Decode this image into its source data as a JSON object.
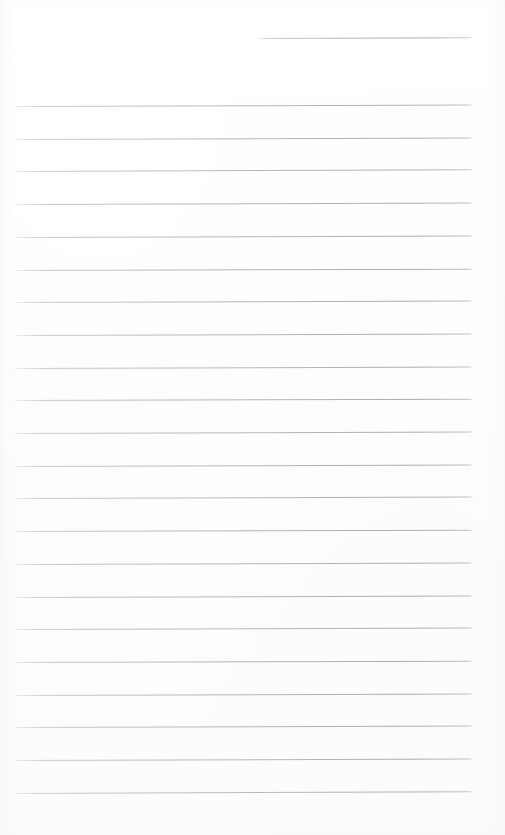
{
  "document": {
    "kind": "scanned-page",
    "subject": "blank ruled notepad page",
    "text_content": "",
    "handwriting_present": false,
    "printed_text_present": false,
    "page_width": 505,
    "page_height": 835
  },
  "colors": {
    "paper": "#fdfdfd",
    "page_border": "#ffffff",
    "rule_line": "#acacb4",
    "rule_line_faded": "#c6c6cb"
  },
  "ruling": {
    "style": "horizontal lined",
    "total_rules": 23,
    "body_rule_count": 22,
    "short_rule_count": 1,
    "line_spacing_px": 32.7,
    "line_thickness_px": 1,
    "body_left_x": 15,
    "body_right_x": 473,
    "first_body_rule_y": 106,
    "last_body_rule_y": 793,
    "scan_skew_deg": -0.18
  },
  "short_rule": {
    "label": "top-right short rule",
    "x": 258,
    "y": 38,
    "width": 214,
    "skew_deg": -0.22
  },
  "body_rules": [
    {
      "index": 1,
      "y": 106.0,
      "x": 15,
      "width": 458,
      "skew_deg": -0.2,
      "opacity": 0.92
    },
    {
      "index": 2,
      "y": 138.7,
      "x": 15,
      "width": 458,
      "skew_deg": -0.19,
      "opacity": 0.95
    },
    {
      "index": 3,
      "y": 171.4,
      "x": 15,
      "width": 458,
      "skew_deg": -0.21,
      "opacity": 0.93
    },
    {
      "index": 4,
      "y": 204.1,
      "x": 15,
      "width": 458,
      "skew_deg": -0.18,
      "opacity": 0.96
    },
    {
      "index": 5,
      "y": 236.8,
      "x": 15,
      "width": 458,
      "skew_deg": -0.2,
      "opacity": 0.94
    },
    {
      "index": 6,
      "y": 269.5,
      "x": 15,
      "width": 458,
      "skew_deg": -0.17,
      "opacity": 0.97
    },
    {
      "index": 7,
      "y": 302.2,
      "x": 15,
      "width": 458,
      "skew_deg": -0.19,
      "opacity": 0.95
    },
    {
      "index": 8,
      "y": 334.9,
      "x": 15,
      "width": 458,
      "skew_deg": -0.18,
      "opacity": 0.96
    },
    {
      "index": 9,
      "y": 367.6,
      "x": 15,
      "width": 458,
      "skew_deg": -0.2,
      "opacity": 0.94
    },
    {
      "index": 10,
      "y": 400.3,
      "x": 15,
      "width": 458,
      "skew_deg": -0.17,
      "opacity": 0.97
    },
    {
      "index": 11,
      "y": 433.0,
      "x": 15,
      "width": 458,
      "skew_deg": -0.19,
      "opacity": 0.95
    },
    {
      "index": 12,
      "y": 465.7,
      "x": 15,
      "width": 458,
      "skew_deg": -0.18,
      "opacity": 0.96
    },
    {
      "index": 13,
      "y": 498.4,
      "x": 15,
      "width": 458,
      "skew_deg": -0.2,
      "opacity": 0.93
    },
    {
      "index": 14,
      "y": 531.1,
      "x": 15,
      "width": 458,
      "skew_deg": -0.17,
      "opacity": 0.97
    },
    {
      "index": 15,
      "y": 563.8,
      "x": 15,
      "width": 458,
      "skew_deg": -0.19,
      "opacity": 0.95
    },
    {
      "index": 16,
      "y": 596.5,
      "x": 15,
      "width": 458,
      "skew_deg": -0.18,
      "opacity": 0.96
    },
    {
      "index": 17,
      "y": 629.2,
      "x": 15,
      "width": 458,
      "skew_deg": -0.2,
      "opacity": 0.94
    },
    {
      "index": 18,
      "y": 661.9,
      "x": 15,
      "width": 458,
      "skew_deg": -0.17,
      "opacity": 0.97
    },
    {
      "index": 19,
      "y": 694.6,
      "x": 15,
      "width": 458,
      "skew_deg": -0.19,
      "opacity": 0.96
    },
    {
      "index": 20,
      "y": 727.3,
      "x": 15,
      "width": 458,
      "skew_deg": -0.18,
      "opacity": 0.95
    },
    {
      "index": 21,
      "y": 760.0,
      "x": 15,
      "width": 458,
      "skew_deg": -0.2,
      "opacity": 0.94
    },
    {
      "index": 22,
      "y": 792.7,
      "x": 15,
      "width": 458,
      "skew_deg": -0.22,
      "opacity": 0.9
    }
  ],
  "margins": {
    "top_blank_px": 106,
    "bottom_blank_px": 42,
    "left_blank_px": 15,
    "right_blank_px": 32
  }
}
